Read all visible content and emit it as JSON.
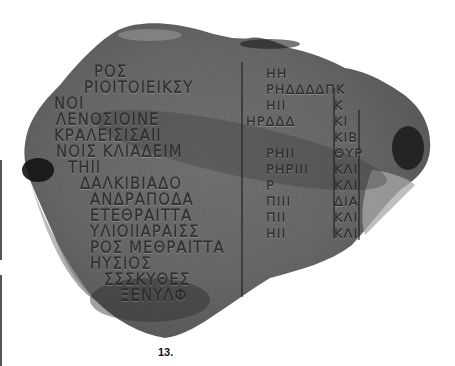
{
  "figure": {
    "caption": "13.",
    "background_color": "#ffffff",
    "stone_color": "#6e6e6e"
  },
  "inscription": {
    "left_column": [
      "ΡΟΣ",
      "ΡΙΟΙΤΟΙΕΙΚΣΥ",
      "ΝΟΙ",
      "ΛΕΝΟΣΙΟΙΝΕ",
      "ΚΡΑΛΕΙΣΙΣΑΙΙ",
      "ΝΟΙΣ ΚΛΙΑΔΕΙΜ",
      "ΤΗΙΙ",
      "ΔΑΛΚΙΒΙΑΔΟ",
      "ΑΝΔΡΑΠΟΔΑ",
      "ΕΤΕΘΡΑΙΤΤΑ",
      "ΥΛΙΟΙΙΑΡΑΙΣΣ",
      "ΡΟΣ ΜΕΘΡΑΙΤΤΑ",
      "ΗΥΣΙΟΣ",
      "ΣΣΣΚΥΘΕΣ",
      "ΞΕΝΥΛΦ"
    ],
    "numeral_column": [
      "ΗΗ",
      "ΡΗΔΔΔΔΠΚ",
      "ΗΙΙ",
      "ΗΡΔΔΔ",
      "",
      "ΡΗΙΙ",
      "ΡΗΡΙΙΙ",
      "Ρ",
      "ΠΙΙΙ",
      "ΠΙΙ",
      "ΗΙΙ"
    ],
    "right_column": [
      "Κ",
      "ΚΙ",
      "ΚΙΒ",
      "ΘΥΡ",
      "ΚΛΙ",
      "ΚΛΙ",
      "ΔΙΑ",
      "ΚΛΙ",
      "ΚΛΙ"
    ]
  }
}
